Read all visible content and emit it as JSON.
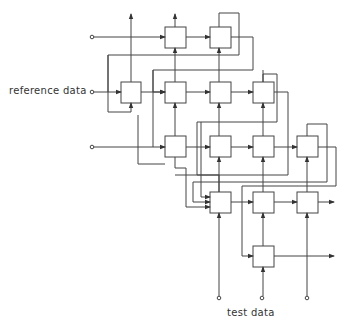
{
  "diagram": {
    "type": "systolic array",
    "labels": {
      "reference_data": "reference data",
      "test_data": "test data"
    },
    "cells": [
      {
        "row": 1,
        "x": 165,
        "y": 27
      },
      {
        "row": 1,
        "x": 210,
        "y": 27
      },
      {
        "row": 2,
        "x": 121,
        "y": 82
      },
      {
        "row": 2,
        "x": 165,
        "y": 82
      },
      {
        "row": 2,
        "x": 210,
        "y": 82
      },
      {
        "row": 2,
        "x": 253,
        "y": 82
      },
      {
        "row": 3,
        "x": 165,
        "y": 136
      },
      {
        "row": 3,
        "x": 210,
        "y": 136
      },
      {
        "row": 3,
        "x": 253,
        "y": 136
      },
      {
        "row": 3,
        "x": 297,
        "y": 136
      },
      {
        "row": 4,
        "x": 210,
        "y": 192
      },
      {
        "row": 4,
        "x": 253,
        "y": 192
      },
      {
        "row": 4,
        "x": 297,
        "y": 192
      },
      {
        "row": 5,
        "x": 253,
        "y": 246
      }
    ],
    "inputs_left": 3,
    "inputs_bottom": 3,
    "line_color": "#333333"
  }
}
